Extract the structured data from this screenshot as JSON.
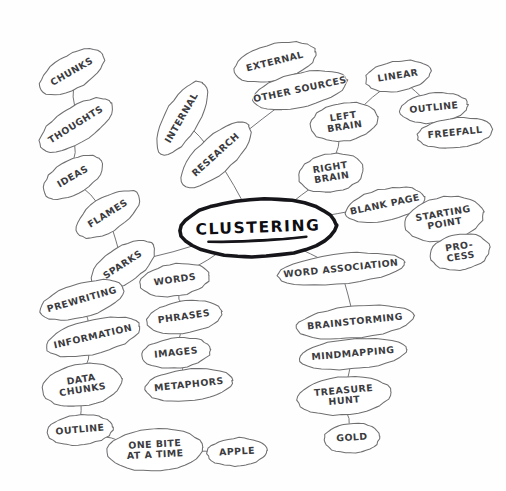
{
  "diagram": {
    "medium": "hand-drawn pencil sketch on white paper",
    "background_color": "#ffffff",
    "ink_color": "#6f6f72",
    "center_ink_color": "#15151a",
    "center": {
      "id": "clustering",
      "label": "CLUSTERING",
      "underlined": true,
      "cx": 258,
      "cy": 228,
      "rx": 78,
      "ry": 29,
      "rotation": -2
    },
    "nodes": [
      {
        "id": "chunks",
        "label": "CHUNKS",
        "cx": 72,
        "cy": 72,
        "rx": 36,
        "ry": 17,
        "rotation": -30
      },
      {
        "id": "thoughts",
        "label": "THOUGHTS",
        "cx": 76,
        "cy": 125,
        "rx": 42,
        "ry": 18,
        "rotation": -32
      },
      {
        "id": "ideas",
        "label": "IDEAS",
        "cx": 73,
        "cy": 177,
        "rx": 33,
        "ry": 17,
        "rotation": -30
      },
      {
        "id": "flames",
        "label": "FLAMES",
        "cx": 108,
        "cy": 214,
        "rx": 36,
        "ry": 17,
        "rotation": -32
      },
      {
        "id": "sparks",
        "label": "SPARKS",
        "cx": 123,
        "cy": 265,
        "rx": 36,
        "ry": 18,
        "rotation": -33
      },
      {
        "id": "internal",
        "label": "INTERNAL",
        "cx": 182,
        "cy": 118,
        "rx": 41,
        "ry": 17,
        "rotation": -60
      },
      {
        "id": "research",
        "label": "RESEARCH",
        "cx": 216,
        "cy": 155,
        "rx": 44,
        "ry": 18,
        "rotation": -42
      },
      {
        "id": "external",
        "label": "EXTERNAL",
        "cx": 275,
        "cy": 62,
        "rx": 42,
        "ry": 18,
        "rotation": -14
      },
      {
        "id": "other-sources",
        "label": "OTHER SOURCES",
        "cx": 300,
        "cy": 90,
        "rx": 48,
        "ry": 17,
        "rotation": -12
      },
      {
        "id": "left-brain",
        "label": "LEFT BRAIN",
        "cx": 344,
        "cy": 122,
        "rx": 34,
        "ry": 19,
        "rotation": -9,
        "lines": [
          "LEFT",
          "BRAIN"
        ]
      },
      {
        "id": "right-brain",
        "label": "RIGHT BRAIN",
        "cx": 331,
        "cy": 173,
        "rx": 33,
        "ry": 19,
        "rotation": -9,
        "lines": [
          "RIGHT",
          "BRAIN"
        ]
      },
      {
        "id": "linear",
        "label": "LINEAR",
        "cx": 398,
        "cy": 76,
        "rx": 33,
        "ry": 15,
        "rotation": -9
      },
      {
        "id": "outline-right",
        "label": "OUTLINE",
        "cx": 434,
        "cy": 108,
        "rx": 34,
        "ry": 15,
        "rotation": -6
      },
      {
        "id": "freefall",
        "label": "FREEFALL",
        "cx": 455,
        "cy": 133,
        "rx": 38,
        "ry": 15,
        "rotation": -6
      },
      {
        "id": "blank-page",
        "label": "BLANK PAGE",
        "cx": 385,
        "cy": 205,
        "rx": 40,
        "ry": 16,
        "rotation": -12
      },
      {
        "id": "starting-point",
        "label": "STARTING POINT",
        "cx": 444,
        "cy": 219,
        "rx": 40,
        "ry": 22,
        "rotation": -10,
        "lines": [
          "STARTING",
          "POINT"
        ]
      },
      {
        "id": "process",
        "label": "PROCESS",
        "cx": 460,
        "cy": 252,
        "rx": 30,
        "ry": 18,
        "rotation": -9,
        "lines": [
          "PRO-",
          "CESS"
        ]
      },
      {
        "id": "word-association",
        "label": "WORD ASSOCIATION",
        "cx": 341,
        "cy": 269,
        "rx": 64,
        "ry": 15,
        "rotation": -6
      },
      {
        "id": "brainstorming",
        "label": "BRAINSTORMING",
        "cx": 355,
        "cy": 322,
        "rx": 59,
        "ry": 16,
        "rotation": -6
      },
      {
        "id": "mindmapping",
        "label": "MINDMAPPING",
        "cx": 353,
        "cy": 354,
        "rx": 54,
        "ry": 15,
        "rotation": -5
      },
      {
        "id": "treasure-hunt",
        "label": "TREASURE HUNT",
        "cx": 344,
        "cy": 396,
        "rx": 47,
        "ry": 19,
        "rotation": -5,
        "lines": [
          "TREASURE",
          "HUNT"
        ]
      },
      {
        "id": "gold",
        "label": "GOLD",
        "cx": 352,
        "cy": 438,
        "rx": 28,
        "ry": 15,
        "rotation": -4
      },
      {
        "id": "words",
        "label": "WORDS",
        "cx": 175,
        "cy": 280,
        "rx": 35,
        "ry": 16,
        "rotation": -8
      },
      {
        "id": "phrases",
        "label": "PHRASES",
        "cx": 184,
        "cy": 317,
        "rx": 38,
        "ry": 16,
        "rotation": -8
      },
      {
        "id": "images",
        "label": "IMAGES",
        "cx": 176,
        "cy": 353,
        "rx": 35,
        "ry": 15,
        "rotation": -6
      },
      {
        "id": "metaphors",
        "label": "METAPHORS",
        "cx": 189,
        "cy": 385,
        "rx": 44,
        "ry": 16,
        "rotation": -6
      },
      {
        "id": "prewriting",
        "label": "PREWRITING",
        "cx": 82,
        "cy": 300,
        "rx": 43,
        "ry": 17,
        "rotation": -16
      },
      {
        "id": "information",
        "label": "INFORMATION",
        "cx": 93,
        "cy": 337,
        "rx": 48,
        "ry": 17,
        "rotation": -13
      },
      {
        "id": "data-chunks",
        "label": "DATA CHUNKS",
        "cx": 82,
        "cy": 385,
        "rx": 40,
        "ry": 21,
        "rotation": -9,
        "lines": [
          "DATA",
          "CHUNKS"
        ]
      },
      {
        "id": "outline-left",
        "label": "OUTLINE",
        "cx": 80,
        "cy": 430,
        "rx": 33,
        "ry": 15,
        "rotation": -5
      },
      {
        "id": "one-bite",
        "label": "ONE BITE AT A TIME",
        "cx": 155,
        "cy": 450,
        "rx": 48,
        "ry": 21,
        "rotation": -3,
        "lines": [
          "ONE BITE",
          "AT A TIME"
        ]
      },
      {
        "id": "apple",
        "label": "APPLE",
        "cx": 237,
        "cy": 452,
        "rx": 30,
        "ry": 14,
        "rotation": -3
      }
    ],
    "edges": [
      {
        "from": "chunks",
        "to": "thoughts"
      },
      {
        "from": "thoughts",
        "to": "ideas"
      },
      {
        "from": "ideas",
        "to": "flames"
      },
      {
        "from": "flames",
        "to": "sparks"
      },
      {
        "from": "sparks",
        "to": "clustering"
      },
      {
        "from": "internal",
        "to": "research"
      },
      {
        "from": "external",
        "to": "other-sources"
      },
      {
        "from": "other-sources",
        "to": "research"
      },
      {
        "from": "research",
        "to": "clustering"
      },
      {
        "from": "left-brain",
        "to": "right-brain"
      },
      {
        "from": "right-brain",
        "to": "clustering"
      },
      {
        "from": "linear",
        "to": "left-brain"
      },
      {
        "from": "linear",
        "to": "outline-right"
      },
      {
        "from": "outline-right",
        "to": "freefall"
      },
      {
        "from": "blank-page",
        "to": "clustering"
      },
      {
        "from": "blank-page",
        "to": "starting-point"
      },
      {
        "from": "starting-point",
        "to": "process"
      },
      {
        "from": "clustering",
        "to": "word-association"
      },
      {
        "from": "word-association",
        "to": "brainstorming"
      },
      {
        "from": "brainstorming",
        "to": "mindmapping"
      },
      {
        "from": "mindmapping",
        "to": "treasure-hunt"
      },
      {
        "from": "treasure-hunt",
        "to": "gold"
      },
      {
        "from": "clustering",
        "to": "words"
      },
      {
        "from": "words",
        "to": "phrases"
      },
      {
        "from": "phrases",
        "to": "images"
      },
      {
        "from": "images",
        "to": "metaphors"
      },
      {
        "from": "sparks",
        "to": "prewriting"
      },
      {
        "from": "prewriting",
        "to": "information"
      },
      {
        "from": "information",
        "to": "data-chunks"
      },
      {
        "from": "data-chunks",
        "to": "outline-left"
      },
      {
        "from": "outline-left",
        "to": "one-bite"
      },
      {
        "from": "one-bite",
        "to": "apple"
      }
    ]
  }
}
